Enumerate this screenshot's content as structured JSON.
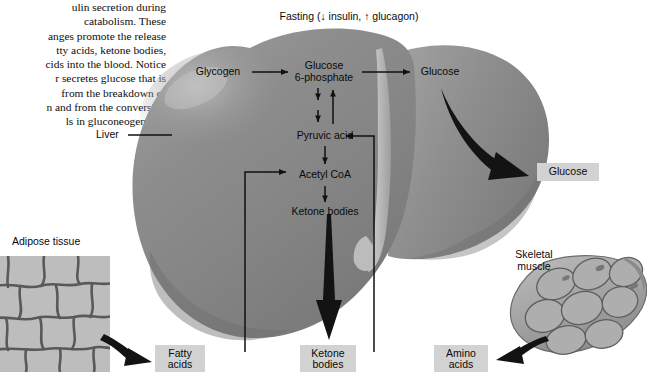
{
  "figure": {
    "caption_lines": [
      "ulin secretion during",
      "catabolism. These",
      "anges promote the release",
      "tty acids, ketone bodies,",
      "cids into the blood. Notice",
      "r secretes glucose that is",
      " from the breakdown of",
      "n and from the conversion",
      "ls in gluconeogenesis."
    ],
    "top_condition": "Fasting (↓ insulin, ↑ glucagon)"
  },
  "organ_labels": {
    "liver": "Liver",
    "adipose": "Adipose tissue",
    "skeletal_muscle": "Skeletal\nmuscle"
  },
  "pathway": {
    "glycogen": "Glycogen",
    "glucose_6_phosphate": "Glucose\n6-phosphate",
    "glucose_liver": "Glucose",
    "pyruvic_acid": "Pyruvic acid",
    "acetyl_coa": "Acetyl CoA",
    "ketone_bodies": "Ketone bodies"
  },
  "output_boxes": {
    "glucose": "Glucose",
    "fatty_acids": "Fatty\nacids",
    "ketone_bodies": "Ketone\nbodies",
    "amino_acids": "Amino\nacids"
  },
  "colors": {
    "liver_body": "#8c8c8c",
    "liver_highlight": "#b3b3b3",
    "liver_shadow": "#6f6f6f",
    "box_fill": "#d2d2d2",
    "arrow": "#111111",
    "adipose_cell": "#b8b8b8",
    "adipose_border": "#4a4a4a",
    "muscle_fill": "#a8a8a8",
    "muscle_border": "#5a5a5a",
    "background": "#ffffff"
  }
}
